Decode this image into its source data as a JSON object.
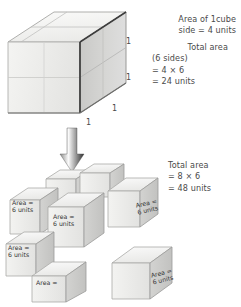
{
  "diagram": {
    "title_semantic": "surface-area-of-cube-decomposition",
    "top_figure": {
      "name": "large-cube-2x2x2",
      "edge_labels": [
        "1",
        "1",
        "1",
        "1"
      ]
    },
    "arrow": {
      "label": "",
      "direction": "down"
    },
    "text_top": {
      "lines": [
        "Area of 1cube",
        "side = 4 units"
      ]
    },
    "text_top_2": {
      "lines": [
        "Total area",
        "(6 sides)",
        "= 4 × 6",
        "= 24 units"
      ]
    },
    "text_bottom": {
      "lines": [
        "Total area",
        "= 8 × 6",
        "= 48 units"
      ]
    },
    "small_cubes": [
      {
        "id": "cube-1",
        "label_line1": "Area =",
        "label_line2": "6 units"
      },
      {
        "id": "cube-2",
        "label_line1": "Area =",
        "label_line2": "6 units"
      },
      {
        "id": "cube-3",
        "label_line1": "Area =",
        "label_line2": "6 units"
      },
      {
        "id": "cube-4",
        "label_line1": "Area =",
        "label_line2": "6 units"
      },
      {
        "id": "cube-5",
        "label_line1": "Area =",
        "label_line2": "6 units"
      },
      {
        "id": "cube-6",
        "label_line1": "Area =",
        "label_line2": "6 units"
      },
      {
        "id": "cube-7",
        "label_line1": "Area =",
        "label_line2": ""
      },
      {
        "id": "cube-8",
        "label_line1": "Area =",
        "label_line2": ""
      }
    ],
    "colors": {
      "face_top": "#f2f2f0",
      "face_left": "#ededeb",
      "face_front": "#d4d4d2",
      "stroke": "#9a9a98",
      "stroke_dark": "#3d3d3d",
      "text": "#4a4a4a",
      "arrow": "#3a3a3a"
    }
  }
}
